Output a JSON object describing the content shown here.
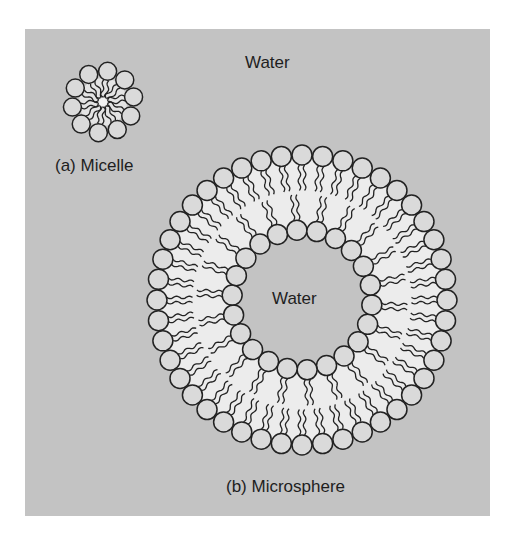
{
  "figure": {
    "background_color": "#c3c3c3",
    "band_color": "#ececec",
    "head_fill": "#dadada",
    "stroke_color": "#222222",
    "labels": {
      "outer_water": "Water",
      "micelle_caption": "(a) Micelle",
      "inner_water": "Water",
      "microsphere_caption": "(b) Microsphere"
    },
    "micelle": {
      "center": [
        103,
        102
      ],
      "head_ring_radius": 31,
      "head_radius": 9,
      "head_count": 10
    },
    "microsphere": {
      "center": [
        302,
        300
      ],
      "outer_head_ring_radius": 145,
      "inner_head_ring_radius": 70,
      "head_radius": 10,
      "outer_head_count": 44,
      "inner_head_count": 22
    }
  }
}
